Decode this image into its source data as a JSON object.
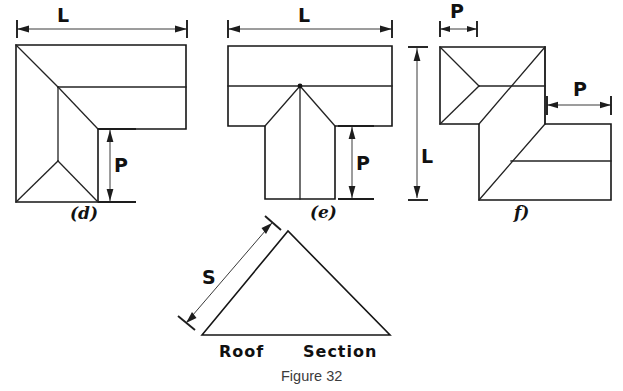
{
  "figure": {
    "caption": "Figure 32",
    "background_color": "#ffffff",
    "ink_color": "#161616",
    "section_title": "Roof  Section"
  },
  "panels": [
    {
      "id": "panel-d",
      "label": "(d)",
      "shape": "L-shaped hip roof plan",
      "dimensions": [
        {
          "name": "L",
          "label": "L",
          "orientation": "horizontal",
          "placement": "top"
        },
        {
          "name": "P",
          "label": "P",
          "orientation": "vertical",
          "placement": "inner-right"
        }
      ]
    },
    {
      "id": "panel-e",
      "label": "(e)",
      "shape": "T-shaped hip roof plan",
      "dimensions": [
        {
          "name": "L",
          "label": "L",
          "orientation": "horizontal",
          "placement": "top"
        },
        {
          "name": "P",
          "label": "P",
          "orientation": "vertical",
          "placement": "right"
        }
      ]
    },
    {
      "id": "panel-f",
      "label": "f)",
      "shape": "Offset / stepped hip roof plan",
      "dimensions": [
        {
          "name": "P-top",
          "label": "P",
          "orientation": "horizontal",
          "placement": "top-left"
        },
        {
          "name": "P-right",
          "label": "P",
          "orientation": "horizontal",
          "placement": "middle-right"
        },
        {
          "name": "L",
          "label": "L",
          "orientation": "vertical",
          "placement": "left"
        }
      ]
    },
    {
      "id": "panel-section",
      "label": "Roof  Section",
      "shape": "Gable roof cross-section triangle",
      "dimensions": [
        {
          "name": "S",
          "label": "S",
          "orientation": "diagonal",
          "placement": "left-slope"
        }
      ]
    }
  ],
  "labels": {
    "L": "L",
    "P": "P",
    "S": "S",
    "panel_d": "(d)",
    "panel_e": "(e)",
    "panel_f": "f)",
    "roof_section_word1": "Roof",
    "roof_section_word2": "Section",
    "caption": "Figure 32"
  }
}
